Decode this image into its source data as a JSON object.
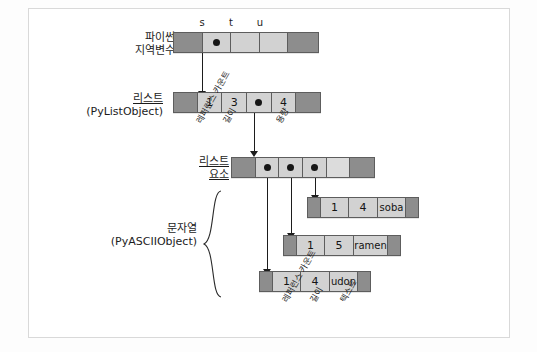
{
  "figure": {
    "title_alt": "Python local variables pointing to a list object and its string elements"
  },
  "rows": {
    "locals": {
      "caption_line1": "파이썬",
      "caption_line2": "지역변수",
      "var_labels": [
        "s",
        "t",
        "u"
      ],
      "cells": [
        {
          "kind": "dark",
          "text": ""
        },
        {
          "kind": "pointer",
          "text": ""
        },
        {
          "kind": "light",
          "text": ""
        },
        {
          "kind": "light",
          "text": ""
        },
        {
          "kind": "dark",
          "text": ""
        }
      ]
    },
    "list_object": {
      "caption_line1": "리스트",
      "caption_line2": "(PyListObject)",
      "cells": [
        {
          "kind": "dark",
          "text": ""
        },
        {
          "kind": "light",
          "text": "1"
        },
        {
          "kind": "light",
          "text": "3"
        },
        {
          "kind": "pointer",
          "text": ""
        },
        {
          "kind": "light",
          "text": "4"
        },
        {
          "kind": "dark",
          "text": ""
        }
      ],
      "field_labels": [
        "레퍼런스 카운트",
        "길이",
        "용량"
      ]
    },
    "list_items": {
      "caption_line1": "리스트",
      "caption_line2": "요소",
      "cells": [
        {
          "kind": "dark",
          "text": ""
        },
        {
          "kind": "pointer",
          "text": ""
        },
        {
          "kind": "pointer",
          "text": ""
        },
        {
          "kind": "pointer",
          "text": ""
        },
        {
          "kind": "light",
          "text": ""
        },
        {
          "kind": "dark",
          "text": ""
        }
      ]
    }
  },
  "strings": {
    "group_caption_line1": "문자열",
    "group_caption_line2": "(PyASCIIObject)",
    "field_labels": [
      "레퍼런스 카운트",
      "길이",
      "텍스트"
    ],
    "objects": [
      {
        "cells": [
          {
            "kind": "dark",
            "text": ""
          },
          {
            "kind": "light",
            "text": "1"
          },
          {
            "kind": "light",
            "text": "4"
          },
          {
            "kind": "light",
            "text": "soba"
          },
          {
            "kind": "dark",
            "text": ""
          }
        ]
      },
      {
        "cells": [
          {
            "kind": "dark",
            "text": ""
          },
          {
            "kind": "light",
            "text": "1"
          },
          {
            "kind": "light",
            "text": "5"
          },
          {
            "kind": "light",
            "text": "ramen"
          },
          {
            "kind": "dark",
            "text": ""
          }
        ]
      },
      {
        "cells": [
          {
            "kind": "dark",
            "text": ""
          },
          {
            "kind": "light",
            "text": "1"
          },
          {
            "kind": "light",
            "text": "4"
          },
          {
            "kind": "light",
            "text": "udon"
          },
          {
            "kind": "dark",
            "text": ""
          }
        ]
      }
    ]
  },
  "colors": {
    "dark_cell": "#8d8d8d",
    "light_cell": "#d2d2d2",
    "border": "#5d5d5d",
    "arrow": "#1d1d1d",
    "frame": "#d9d9d9"
  }
}
